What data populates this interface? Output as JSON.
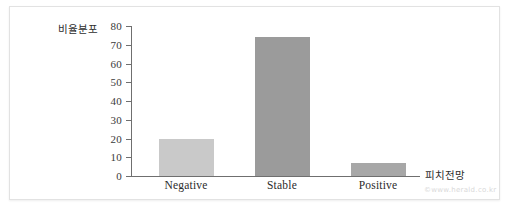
{
  "chart_data": {
    "type": "bar",
    "title": "",
    "subtitle": "",
    "categories": [
      "Negative",
      "Stable",
      "Positive"
    ],
    "values": [
      20,
      74,
      7
    ],
    "xlabel": "피치전망",
    "ylabel": "비율분포",
    "ylim": [
      0,
      80
    ],
    "yticks": [
      0,
      10,
      20,
      30,
      40,
      50,
      60,
      70,
      80
    ],
    "ytick_labels": [
      "0",
      "10",
      "20",
      "30",
      "40",
      "50",
      "60",
      "70",
      "80"
    ],
    "grid": false,
    "legend": "none",
    "bar_colors": [
      "#c9c9c9",
      "#9b9b9b",
      "#a7a7a7"
    ],
    "axis_color": "#6f6f6f"
  },
  "axes": {
    "y_title": "비율분포",
    "x_title": "피치전망"
  },
  "watermark": {
    "text": "©www.herald.co.kr"
  },
  "colors": {
    "background": "#ffffff",
    "frame": "#e2e2e2",
    "axis": "#6f6f6f",
    "tick_text": "#3a3a3a",
    "bar_light": "#c9c9c9",
    "bar_dark": "#9b9b9b",
    "bar_mid": "#a7a7a7",
    "watermark": "#d9d9d9"
  }
}
